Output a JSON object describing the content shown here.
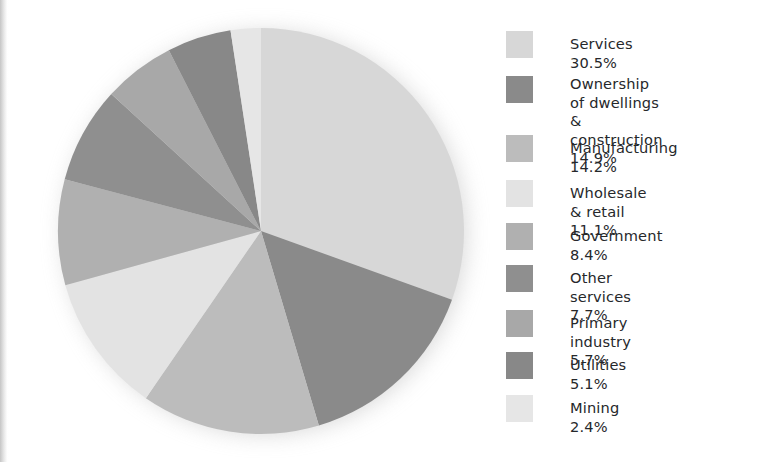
{
  "chart_data": {
    "type": "pie",
    "title": "",
    "subtitle": "",
    "xlabel": "",
    "ylabel": "",
    "units": "percent",
    "legend_position": "right",
    "grid": false,
    "start_angle_deg": 0,
    "direction": "clockwise",
    "categories": [
      "Services",
      "Ownership of dwellings & construction",
      "Manufacturing",
      "Wholesale & retail",
      "Government",
      "Other services",
      "Primary industry",
      "Utilities",
      "Mining"
    ],
    "values": [
      30.5,
      14.9,
      14.2,
      11.1,
      8.4,
      7.7,
      5.7,
      5.1,
      2.4
    ],
    "colors": [
      "#d7d7d7",
      "#8a8a8a",
      "#bcbcbc",
      "#e3e3e3",
      "#b0b0b0",
      "#8f8f8f",
      "#a8a8a8",
      "#888888",
      "#e6e6e6"
    ],
    "total": 100.0
  },
  "legend": {
    "items": [
      {
        "label": "Services 30.5%",
        "percent": "30.5%",
        "name": "Services",
        "color": "#d7d7d7"
      },
      {
        "label": "Ownership of dwellings\n& construction 14.9%",
        "percent": "14.9%",
        "name": "Ownership of dwellings & construction",
        "color": "#8a8a8a"
      },
      {
        "label": "Manufacturing 14.2%",
        "percent": "14.2%",
        "name": "Manufacturing",
        "color": "#bcbcbc"
      },
      {
        "label": "Wholesale & retail 11.1%",
        "percent": "11.1%",
        "name": "Wholesale & retail",
        "color": "#e3e3e3"
      },
      {
        "label": "Government 8.4%",
        "percent": "8.4%",
        "name": "Government",
        "color": "#b0b0b0"
      },
      {
        "label": "Other services 7.7%",
        "percent": "7.7%",
        "name": "Other services",
        "color": "#8f8f8f"
      },
      {
        "label": "Primary industry 5.7%",
        "percent": "5.7%",
        "name": "Primary industry",
        "color": "#a8a8a8"
      },
      {
        "label": "Utilities 5.1%",
        "percent": "5.1%",
        "name": "Utilities",
        "color": "#888888"
      },
      {
        "label": "Mining 2.4%",
        "percent": "2.4%",
        "name": "Mining",
        "color": "#e6e6e6"
      }
    ]
  },
  "colors": {
    "background": "#ffffff",
    "text": "#26282b",
    "shadow": "#b9b9b9"
  }
}
